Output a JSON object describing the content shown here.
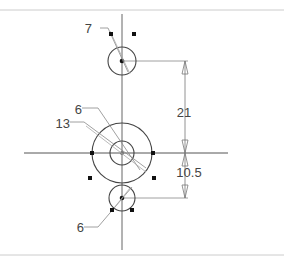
{
  "drawing": {
    "colors": {
      "line": "#555555",
      "thin": "#888888",
      "grip": "#111111",
      "border": "#cccccc",
      "text": "#444444"
    },
    "circles": [
      {
        "name": "top-hole",
        "cx": 122,
        "cy": 61,
        "r": 14
      },
      {
        "name": "center-outer",
        "cx": 122,
        "cy": 153,
        "r": 30
      },
      {
        "name": "center-inner",
        "cx": 122,
        "cy": 153,
        "r": 12
      },
      {
        "name": "bottom-hole",
        "cx": 122,
        "cy": 198,
        "r": 13
      }
    ],
    "leaders": [
      {
        "label": "7",
        "text_x": 92,
        "text_y": 35
      },
      {
        "label": "6",
        "text_x": 74,
        "text_y": 114
      },
      {
        "label": "13",
        "text_x": 56,
        "text_y": 128
      },
      {
        "label": "6",
        "text_x": 75,
        "text_y": 232
      }
    ],
    "dimensions": [
      {
        "label": "21",
        "from_y": 61,
        "to_y": 153
      },
      {
        "label": "10.5",
        "from_y": 153,
        "to_y": 198
      }
    ]
  }
}
